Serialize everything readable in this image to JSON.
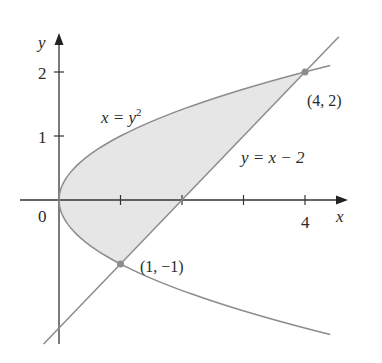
{
  "chart_data": {
    "type": "line",
    "title": "",
    "xlabel": "x",
    "ylabel": "y",
    "xlim": [
      -0.6,
      4.7
    ],
    "ylim": [
      -2.25,
      2.6
    ],
    "grid": false,
    "x_ticks": [
      {
        "value": 1,
        "label": ""
      },
      {
        "value": 2,
        "label": ""
      },
      {
        "value": 3,
        "label": ""
      },
      {
        "value": 4,
        "label": "4"
      }
    ],
    "y_ticks": [
      {
        "value": 1,
        "label": "1"
      },
      {
        "value": 2,
        "label": "2"
      }
    ],
    "origin_label": "0",
    "series": [
      {
        "name": "x = y^2",
        "label": "x = y",
        "label_sup": "2",
        "kind": "parabola (x as function of y)",
        "y_range": [
          -2.1,
          2.1
        ],
        "color": "#8c8c8c"
      },
      {
        "name": "y = x - 2",
        "label": "y = x − 2",
        "kind": "line",
        "x_range": [
          -0.25,
          4.55
        ],
        "color": "#8c8c8c"
      }
    ],
    "shaded_region": {
      "description": "Region bounded by x = y^2 and y = x - 2",
      "y_range": [
        -1,
        2
      ],
      "fill": "#e6e6e6"
    },
    "annotations": [
      {
        "point": [
          4,
          2
        ],
        "label": "(4, 2)"
      },
      {
        "point": [
          1,
          -1
        ],
        "label": "(1, −1)"
      }
    ]
  }
}
